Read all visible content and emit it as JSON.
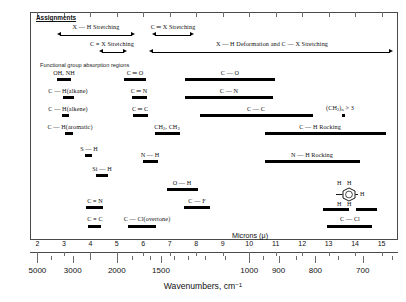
{
  "chart_data": {
    "type": "bar",
    "xlabel": "Wavenumbers, cm⁻¹",
    "secondary_xlabel": "Microns (μ)",
    "micron_axis": {
      "label": "Microns (μ)",
      "ticks": [
        2,
        3,
        4,
        5,
        6,
        7,
        8,
        9,
        10,
        11,
        12,
        13,
        14,
        15
      ],
      "range": [
        1.7,
        15.6
      ]
    },
    "wavenumber_axis": {
      "label": "Wavenumbers, cm⁻¹",
      "labeled_ticks": [
        5000,
        3000,
        2000,
        1500,
        1000,
        900,
        800,
        700
      ],
      "minor_ticks": [
        4000,
        2500,
        1800,
        1600,
        1400,
        1300,
        1200,
        1100,
        950,
        850,
        750,
        650
      ]
    },
    "assignments_header": "Assignments",
    "functional_note": "Functional group absorption regions",
    "assignment_spans": [
      {
        "label": "X — H Stretching",
        "from_micron": 2.6,
        "to_micron": 4.05
      },
      {
        "label": "C ═ X Stretching",
        "from_micron": 4.3,
        "to_micron": 5.05
      },
      {
        "label": "C ≡ X Stretching",
        "from_micron": 4.55,
        "to_micron": 5.35
      },
      {
        "label": "X — H Deformation and C — X Stretching",
        "from_micron": 6.45,
        "to_micron": 15.3
      }
    ],
    "bands": [
      {
        "label": "OH, NH",
        "from_micron": 2.7,
        "to_micron": 3.1,
        "row": 0
      },
      {
        "label": "C ═ O",
        "from_micron": 5.55,
        "to_micron": 6.15,
        "row": 0
      },
      {
        "label": "C — O",
        "from_micron": 7.6,
        "to_micron": 10.3,
        "row": 0
      },
      {
        "label": "C — H(alkane)",
        "from_micron": 3.35,
        "to_micron": 3.6,
        "row": 1
      },
      {
        "label": "C ═ N",
        "from_micron": 5.8,
        "to_micron": 6.2,
        "row": 1
      },
      {
        "label": "C — N",
        "from_micron": 7.6,
        "to_micron": 10.15,
        "row": 1
      },
      {
        "label": "C — H(alkene)",
        "from_micron": 3.25,
        "to_micron": 3.4,
        "row": 2
      },
      {
        "label": "C ═ C",
        "from_micron": 5.95,
        "to_micron": 6.35,
        "row": 2
      },
      {
        "label": "C — C",
        "from_micron": 8.2,
        "to_micron": 11.6,
        "row": 2
      },
      {
        "label": "(CH₂)ₙ > 3",
        "from_micron": 13.55,
        "to_micron": 13.75,
        "row": 2
      },
      {
        "label": "C — H(aromatic)",
        "from_micron": 3.2,
        "to_micron": 3.4,
        "row": 3
      },
      {
        "label": "CH₂, CH₃",
        "from_micron": 6.75,
        "to_micron": 7.45,
        "row": 3
      },
      {
        "label": "C — H Rocking",
        "from_micron": 11.0,
        "to_micron": 15.1,
        "row": 3
      },
      {
        "label": "S — H",
        "from_micron": 3.85,
        "to_micron": 4.05,
        "row": 4
      },
      {
        "label": "N — H",
        "from_micron": 6.3,
        "to_micron": 6.85,
        "row": 4
      },
      {
        "label": "N — H Rocking",
        "from_micron": 11.0,
        "to_micron": 14.4,
        "row": 4
      },
      {
        "label": "Si — H",
        "from_micron": 4.45,
        "to_micron": 4.75,
        "row": 5
      },
      {
        "label": "O — H",
        "from_micron": 6.95,
        "to_micron": 7.95,
        "row": 5
      },
      {
        "label": "C ≡ N",
        "from_micron": 4.35,
        "to_micron": 4.75,
        "row": 6
      },
      {
        "label": "C — F",
        "from_micron": 8.6,
        "to_micron": 9.5,
        "row": 6
      },
      {
        "label": "C ≡ C",
        "from_micron": 4.55,
        "to_micron": 4.85,
        "row": 7
      },
      {
        "label": "C — Cl(overtone)",
        "from_micron": 6.55,
        "to_micron": 7.35,
        "row": 7
      },
      {
        "label": "C — Cl",
        "from_micron": 12.9,
        "to_micron": 14.2,
        "row": 7
      }
    ],
    "aromatic_substitution_glyph": {
      "hydrogens": [
        "H",
        "H",
        "H",
        "H",
        "H"
      ],
      "from_micron": 12.7,
      "to_micron": 14.5
    }
  },
  "chart": {
    "assignments_label": "Assignments",
    "functional_group_note": "Functional group absorption regions",
    "micron_caption": "Microns (μ)",
    "wavenumber_caption_main": "Wavenumbers, cm",
    "wavenumber_caption_sup": "−1",
    "span_xh_stretching": "X — H Stretching",
    "span_cx_double": "C ═ X Stretching",
    "span_cx_triple": "C ≡ X Stretching",
    "span_deformation": "X — H Deformation and C — X Stretching",
    "b_ohnh": "OH, NH",
    "b_co_double": "C ═ O",
    "b_co_single": "C — O",
    "b_ch_alkane": "C — H(alkane)",
    "b_cn_double": "C ═ N",
    "b_cn_single": "C — N",
    "b_ch_alkene": "C — H(alkene)",
    "b_cc_double": "C ═ C",
    "b_cc_single": "C — C",
    "b_ch2n_pre": "(CH",
    "b_ch2n_sub": "2",
    "b_ch2n_post": ")",
    "b_ch2n_nsub": "n",
    "b_ch2n_tail": " > 3",
    "b_ch_aromatic": "C — H(aromatic)",
    "b_ch2ch3_a": "CH",
    "b_ch2ch3_a_sub": "2",
    "b_ch2ch3_b": ", CH",
    "b_ch2ch3_b_sub": "3",
    "b_ch_rocking": "C — H Rocking",
    "b_sh": "S — H",
    "b_nh": "N — H",
    "b_nh_rocking": "N — H Rocking",
    "b_sih": "Si — H",
    "b_oh": "O — H",
    "b_cn_triple": "C ≡ N",
    "b_cf": "C — F",
    "b_cc_triple": "C ≡ C",
    "b_ccl_overtone": "C — Cl(overtone)",
    "b_ccl": "C — Cl",
    "ring_h_tl": "H",
    "ring_h_tr": "H",
    "ring_h_right": "H",
    "ring_h_bl": "H",
    "ring_h_br": "H",
    "mt_2": "2",
    "mt_3": "3",
    "mt_4": "4",
    "mt_5": "5",
    "mt_6": "6",
    "mt_7": "7",
    "mt_8": "8",
    "mt_9": "9",
    "mt_10": "10",
    "mt_11": "11",
    "mt_12": "12",
    "mt_13": "13",
    "mt_14": "14",
    "mt_15": "15",
    "wn_5000": "5000",
    "wn_3000": "3000",
    "wn_2000": "2000",
    "wn_1500": "1500",
    "wn_1000": "1000",
    "wn_900": "900",
    "wn_800": "800",
    "wn_700": "700"
  }
}
